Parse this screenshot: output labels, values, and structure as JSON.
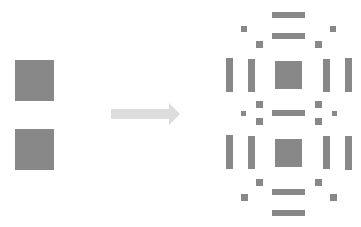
{
  "diagram": {
    "colors": {
      "block": "#888888",
      "arrow": "#dddddd",
      "background": "#ffffff"
    },
    "input": {
      "squares": [
        {
          "x": 15,
          "y": 60,
          "w": 39,
          "h": 41
        },
        {
          "x": 15,
          "y": 129,
          "w": 39,
          "h": 41
        }
      ]
    },
    "arrow": {
      "x1": 111,
      "x2": 179,
      "y": 113
    },
    "output": {
      "center_squares": [
        {
          "x": 275,
          "y": 61,
          "w": 27,
          "h": 28
        },
        {
          "x": 275,
          "y": 139,
          "w": 27,
          "h": 28
        }
      ],
      "horizontal_bars": [
        {
          "x": 272,
          "y": 12,
          "w": 33,
          "h": 6
        },
        {
          "x": 272,
          "y": 33,
          "w": 33,
          "h": 6
        },
        {
          "x": 272,
          "y": 110,
          "w": 33,
          "h": 6
        },
        {
          "x": 272,
          "y": 189,
          "w": 33,
          "h": 6
        },
        {
          "x": 272,
          "y": 210,
          "w": 33,
          "h": 6
        }
      ],
      "vertical_bars": [
        {
          "x": 226,
          "y": 58,
          "w": 7,
          "h": 34
        },
        {
          "x": 248,
          "y": 59,
          "w": 7,
          "h": 33
        },
        {
          "x": 323,
          "y": 59,
          "w": 7,
          "h": 33
        },
        {
          "x": 345,
          "y": 58,
          "w": 7,
          "h": 34
        },
        {
          "x": 226,
          "y": 135,
          "w": 7,
          "h": 34
        },
        {
          "x": 248,
          "y": 136,
          "w": 7,
          "h": 33
        },
        {
          "x": 323,
          "y": 136,
          "w": 7,
          "h": 33
        },
        {
          "x": 345,
          "y": 136,
          "w": 7,
          "h": 34
        }
      ],
      "small_squares": [
        {
          "x": 241,
          "y": 26,
          "w": 6,
          "h": 6
        },
        {
          "x": 330,
          "y": 26,
          "w": 6,
          "h": 6
        },
        {
          "x": 256,
          "y": 41,
          "w": 7,
          "h": 7
        },
        {
          "x": 315,
          "y": 41,
          "w": 7,
          "h": 7
        },
        {
          "x": 256,
          "y": 101,
          "w": 7,
          "h": 7
        },
        {
          "x": 315,
          "y": 101,
          "w": 7,
          "h": 7
        },
        {
          "x": 241,
          "y": 111,
          "w": 5,
          "h": 5
        },
        {
          "x": 332,
          "y": 111,
          "w": 5,
          "h": 5
        },
        {
          "x": 256,
          "y": 118,
          "w": 7,
          "h": 7
        },
        {
          "x": 315,
          "y": 118,
          "w": 7,
          "h": 7
        },
        {
          "x": 256,
          "y": 179,
          "w": 7,
          "h": 7
        },
        {
          "x": 315,
          "y": 179,
          "w": 7,
          "h": 7
        },
        {
          "x": 241,
          "y": 194,
          "w": 7,
          "h": 7
        },
        {
          "x": 330,
          "y": 194,
          "w": 7,
          "h": 7
        }
      ]
    }
  }
}
